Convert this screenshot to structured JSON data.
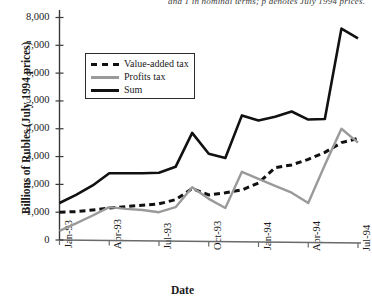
{
  "figure": {
    "top_cut_text": "and 1 in nominal terms; p denotes July 1994 prices.",
    "xlabel": "Date",
    "ylabel": "Billions of Rubles (July 1994 prices)"
  },
  "legend": {
    "items": [
      {
        "label": "Value-added tax",
        "style": "dashed",
        "color": "#111111"
      },
      {
        "label": "Profits tax",
        "style": "solid",
        "color": "#9a9a9a"
      },
      {
        "label": "Sum",
        "style": "solid",
        "color": "#111111"
      }
    ]
  },
  "axes": {
    "y_ticks": [
      "0",
      "1,000",
      "2,000",
      "3,000",
      "4,000",
      "5,000",
      "6,000",
      "7,000",
      "8,000"
    ],
    "x_ticks": [
      "Jan-93",
      "Apr-93",
      "Jul-93",
      "Oct-93",
      "Jan-94",
      "Apr-94",
      "Jul-94"
    ]
  },
  "chart_data": {
    "type": "line",
    "title": "",
    "xlabel": "Date",
    "ylabel": "Billions of Rubles (July 1994 prices)",
    "ylim": [
      0,
      8000
    ],
    "ytick_step": 1000,
    "grid": false,
    "legend_position": "upper-left-inside",
    "x": [
      "Jan-93",
      "Feb-93",
      "Mar-93",
      "Apr-93",
      "May-93",
      "Jun-93",
      "Jul-93",
      "Aug-93",
      "Sep-93",
      "Oct-93",
      "Nov-93",
      "Dec-93",
      "Jan-94",
      "Feb-94",
      "Mar-94",
      "Apr-94",
      "May-94",
      "Jun-94",
      "Jul-94"
    ],
    "x_tick_indices": [
      0,
      3,
      6,
      9,
      12,
      15,
      18
    ],
    "series": [
      {
        "name": "Value-added tax",
        "color": "#111111",
        "style": "dashed",
        "values": [
          1000,
          1020,
          1080,
          1150,
          1200,
          1250,
          1300,
          1450,
          1850,
          1620,
          1700,
          1800,
          2050,
          2600,
          2700,
          2900,
          3150,
          3500,
          3650
        ]
      },
      {
        "name": "Profits tax",
        "color": "#9a9a9a",
        "style": "solid",
        "values": [
          330,
          600,
          880,
          1180,
          1120,
          1080,
          1000,
          1180,
          1900,
          1480,
          1150,
          2450,
          2200,
          1950,
          1700,
          1330,
          2700,
          4000,
          3500
        ]
      },
      {
        "name": "Sum",
        "color": "#111111",
        "style": "solid",
        "values": [
          1330,
          1620,
          1960,
          2400,
          2400,
          2400,
          2420,
          2630,
          3850,
          3100,
          2950,
          4480,
          4300,
          4430,
          4620,
          4330,
          4350,
          7600,
          7250
        ]
      }
    ]
  }
}
